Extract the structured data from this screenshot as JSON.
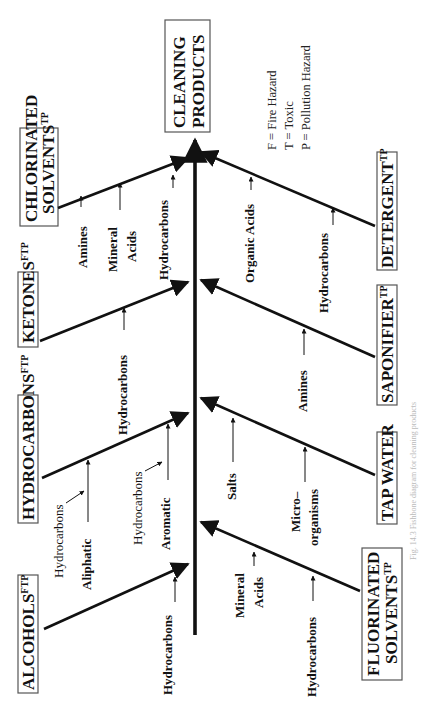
{
  "diagram": {
    "type": "fishbone",
    "orientation": "rotated-90-ccw",
    "effect": {
      "label_line1": "CLEANING",
      "label_line2": "PRODUCTS"
    },
    "legend": [
      {
        "text": "F = Fire Hazard"
      },
      {
        "text": "T = Toxic"
      },
      {
        "text": "P = Pollution Hazard"
      }
    ],
    "categories_left": [
      {
        "id": "chlorinated",
        "line1": "CHLORINATED",
        "line2": "SOLVENTS",
        "sup": "TP",
        "causes": [
          {
            "text": "Amines",
            "bold": true
          },
          {
            "text": "Mineral",
            "text2": "Acids",
            "bold": true
          },
          {
            "text": "Hydrocarbons",
            "bold": true
          }
        ]
      },
      {
        "id": "ketones",
        "line1": "KETONES",
        "sup": "FTP",
        "causes": [
          {
            "text": "Hydrocarbons",
            "bold": true
          }
        ]
      },
      {
        "id": "hydrocarbons",
        "line1": "HYDROCARBONS",
        "sup": "FTP",
        "causes": [
          {
            "text": "Aliphatic",
            "bold": true,
            "sub": "Hydrocarbons"
          },
          {
            "text": "Aromatic",
            "bold": true,
            "sub": "Hydrocarbons"
          }
        ]
      },
      {
        "id": "alcohols",
        "line1": "ALCOHOLS",
        "sup": "FTP",
        "causes": [
          {
            "text": "Hydrocarbons",
            "bold": true
          }
        ]
      }
    ],
    "categories_right": [
      {
        "id": "detergent",
        "line1": "DETERGENT",
        "sup": "TP",
        "causes": [
          {
            "text": "Organic Acids",
            "bold": true
          },
          {
            "text": "Hydrocarbons",
            "bold": true
          }
        ]
      },
      {
        "id": "saponifier",
        "line1": "SAPONIFIER",
        "sup": "TP",
        "causes": [
          {
            "text": "Amines",
            "bold": true
          }
        ]
      },
      {
        "id": "tapwater",
        "line1": "TAP WATER",
        "sup": "",
        "causes": [
          {
            "text": "Salts",
            "bold": true
          },
          {
            "text": "Micro–",
            "text2": "organisms",
            "bold": true
          }
        ]
      },
      {
        "id": "fluorinated",
        "line1": "FLUORINATED",
        "line2": "SOLVENTS",
        "sup": "TP",
        "causes": [
          {
            "text": "Mineral",
            "text2": "Acids",
            "bold": true
          },
          {
            "text": "Hydrocarbons",
            "bold": true
          }
        ]
      }
    ],
    "caption": "Fig. 14.3 Fishbone diagram for cleaning products"
  }
}
